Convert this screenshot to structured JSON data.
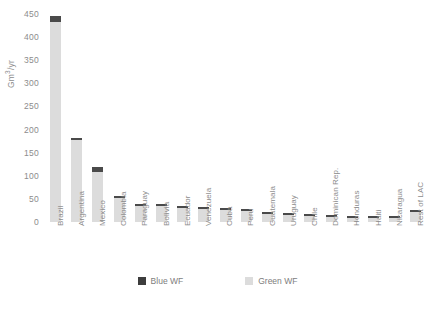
{
  "chart_data": {
    "type": "bar",
    "stacked": true,
    "title": "",
    "xlabel": "",
    "ylabel": "Gm3/yr",
    "ylabel_display": "Gm³/yr",
    "ylim": [
      0,
      450
    ],
    "yticks": [
      450,
      400,
      350,
      300,
      250,
      200,
      150,
      100,
      50,
      0
    ],
    "ytick_labels": [
      "450",
      "400",
      "350",
      "300",
      "250",
      "200",
      "150",
      "100",
      "50",
      "0"
    ],
    "grid": false,
    "legend_position": "bottom-center",
    "categories": [
      "Brazil",
      "Argentina",
      "Mexico",
      "Colombia",
      "Paraguay",
      "Bolivia",
      "Ecuador",
      "Venezuela",
      "Cuba",
      "Peru",
      "Guatemala",
      "Uruguay",
      "Chile",
      "Dominican Rep.",
      "Honduras",
      "Haiti",
      "Nicaragua",
      "Rest of LAC"
    ],
    "series": [
      {
        "name": "Green WF",
        "color": "#dcdcdc",
        "values": [
          432,
          177,
          109,
          52,
          35,
          34,
          30,
          28,
          25,
          24,
          17,
          15,
          14,
          10,
          9,
          8,
          8,
          21
        ]
      },
      {
        "name": "Blue WF",
        "color": "#4a4a4a",
        "values": [
          13,
          3,
          11,
          3,
          2,
          2,
          2,
          2,
          2,
          2,
          3,
          2,
          2,
          2,
          2,
          2,
          2,
          2
        ]
      }
    ],
    "totals": [
      445,
      180,
      120,
      55,
      37,
      36,
      32,
      30,
      27,
      26,
      20,
      17,
      16,
      12,
      11,
      10,
      10,
      23
    ]
  },
  "legend": {
    "items": [
      {
        "label": "Blue WF",
        "swatch": "blue"
      },
      {
        "label": "Green WF",
        "swatch": "green"
      }
    ]
  },
  "caption": {
    "text": ""
  }
}
